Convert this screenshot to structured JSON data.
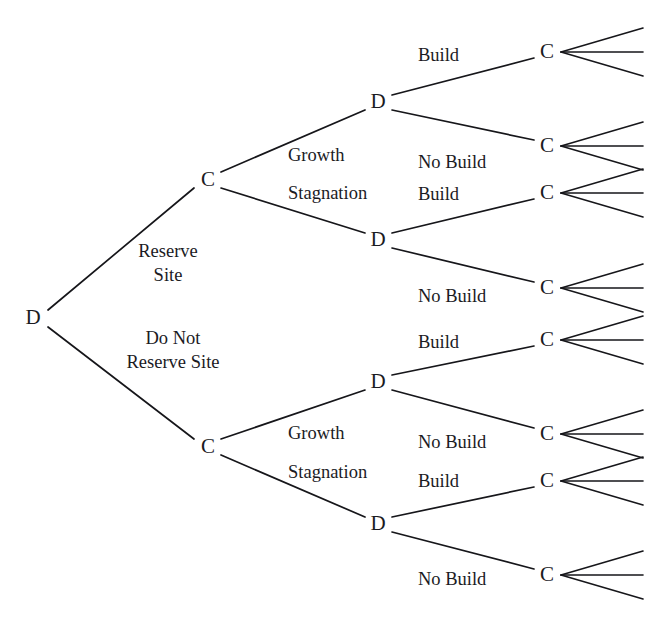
{
  "diagram": {
    "type": "decision-tree",
    "background_color": "#ffffff",
    "line_color": "#16161a",
    "text_color": "#1b1b1f"
  },
  "node_labels": {
    "decision": "D",
    "chance": "C"
  },
  "nodes": [
    {
      "id": "root",
      "glyph": "D",
      "x": 33,
      "y": 318,
      "kind": "decision"
    },
    {
      "id": "c-up",
      "glyph": "C",
      "x": 208,
      "y": 180,
      "kind": "chance"
    },
    {
      "id": "c-dn",
      "glyph": "C",
      "x": 208,
      "y": 447,
      "kind": "chance"
    },
    {
      "id": "d-1",
      "glyph": "D",
      "x": 378,
      "y": 102,
      "kind": "decision"
    },
    {
      "id": "d-2",
      "glyph": "D",
      "x": 378,
      "y": 240,
      "kind": "decision"
    },
    {
      "id": "d-3",
      "glyph": "D",
      "x": 378,
      "y": 382,
      "kind": "decision"
    },
    {
      "id": "d-4",
      "glyph": "D",
      "x": 378,
      "y": 524,
      "kind": "decision"
    },
    {
      "id": "term-1",
      "glyph": "C",
      "x": 547,
      "y": 52,
      "kind": "chance"
    },
    {
      "id": "term-2",
      "glyph": "C",
      "x": 547,
      "y": 146,
      "kind": "chance"
    },
    {
      "id": "term-3",
      "glyph": "C",
      "x": 547,
      "y": 193,
      "kind": "chance"
    },
    {
      "id": "term-4",
      "glyph": "C",
      "x": 547,
      "y": 288,
      "kind": "chance"
    },
    {
      "id": "term-5",
      "glyph": "C",
      "x": 547,
      "y": 340,
      "kind": "chance"
    },
    {
      "id": "term-6",
      "glyph": "C",
      "x": 547,
      "y": 434,
      "kind": "chance"
    },
    {
      "id": "term-7",
      "glyph": "C",
      "x": 547,
      "y": 481,
      "kind": "chance"
    },
    {
      "id": "term-8",
      "glyph": "C",
      "x": 547,
      "y": 575,
      "kind": "chance"
    }
  ],
  "edges": [
    {
      "id": "root-up",
      "from": "root",
      "to": "c-up",
      "x1": 48,
      "y1": 310,
      "x2": 194,
      "y2": 188
    },
    {
      "id": "root-dn",
      "from": "root",
      "to": "c-dn",
      "x1": 48,
      "y1": 327,
      "x2": 194,
      "y2": 439
    },
    {
      "id": "cup-d1",
      "from": "c-up",
      "to": "d-1",
      "x1": 221,
      "y1": 172,
      "x2": 365,
      "y2": 110
    },
    {
      "id": "cup-d2",
      "from": "c-up",
      "to": "d-2",
      "x1": 221,
      "y1": 188,
      "x2": 365,
      "y2": 233
    },
    {
      "id": "cdn-d3",
      "from": "c-dn",
      "to": "d-3",
      "x1": 221,
      "y1": 439,
      "x2": 365,
      "y2": 390
    },
    {
      "id": "cdn-d4",
      "from": "c-dn",
      "to": "d-4",
      "x1": 221,
      "y1": 455,
      "x2": 365,
      "y2": 517
    },
    {
      "id": "d1-t1",
      "from": "d-1",
      "to": "term-1",
      "x1": 392,
      "y1": 95,
      "x2": 534,
      "y2": 58
    },
    {
      "id": "d1-t2",
      "from": "d-1",
      "to": "term-2",
      "x1": 392,
      "y1": 110,
      "x2": 534,
      "y2": 140
    },
    {
      "id": "d2-t3",
      "from": "d-2",
      "to": "term-3",
      "x1": 392,
      "y1": 233,
      "x2": 534,
      "y2": 199
    },
    {
      "id": "d2-t4",
      "from": "d-2",
      "to": "term-4",
      "x1": 392,
      "y1": 248,
      "x2": 534,
      "y2": 282
    },
    {
      "id": "d3-t5",
      "from": "d-3",
      "to": "term-5",
      "x1": 392,
      "y1": 375,
      "x2": 534,
      "y2": 346
    },
    {
      "id": "d3-t6",
      "from": "d-3",
      "to": "term-6",
      "x1": 392,
      "y1": 390,
      "x2": 534,
      "y2": 428
    },
    {
      "id": "d4-t7",
      "from": "d-4",
      "to": "term-7",
      "x1": 392,
      "y1": 517,
      "x2": 534,
      "y2": 487
    },
    {
      "id": "d4-t8",
      "from": "d-4",
      "to": "term-8",
      "x1": 392,
      "y1": 532,
      "x2": 534,
      "y2": 569
    }
  ],
  "edge_labels": [
    {
      "id": "lbl-reserve-site",
      "lines": [
        "Reserve",
        "Site"
      ],
      "x": 168,
      "y": 257,
      "align": "center"
    },
    {
      "id": "lbl-no-reserve-site",
      "lines": [
        "Do Not",
        "Reserve Site"
      ],
      "x": 173,
      "y": 344,
      "align": "center"
    },
    {
      "id": "lbl-growth-upper",
      "lines": [
        "Growth"
      ],
      "x": 288,
      "y": 161,
      "align": "start"
    },
    {
      "id": "lbl-stagnation-upper",
      "lines": [
        "Stagnation"
      ],
      "x": 288,
      "y": 199,
      "align": "start"
    },
    {
      "id": "lbl-growth-lower",
      "lines": [
        "Growth"
      ],
      "x": 288,
      "y": 439,
      "align": "start"
    },
    {
      "id": "lbl-stagnation-lower",
      "lines": [
        "Stagnation"
      ],
      "x": 288,
      "y": 478,
      "align": "start"
    },
    {
      "id": "lbl-build-1",
      "lines": [
        "Build"
      ],
      "x": 418,
      "y": 61,
      "align": "start"
    },
    {
      "id": "lbl-no-build-1",
      "lines": [
        "No Build"
      ],
      "x": 418,
      "y": 168,
      "align": "start"
    },
    {
      "id": "lbl-build-2",
      "lines": [
        "Build"
      ],
      "x": 418,
      "y": 200,
      "align": "start"
    },
    {
      "id": "lbl-no-build-2",
      "lines": [
        "No Build"
      ],
      "x": 418,
      "y": 302,
      "align": "start"
    },
    {
      "id": "lbl-build-3",
      "lines": [
        "Build"
      ],
      "x": 418,
      "y": 348,
      "align": "start"
    },
    {
      "id": "lbl-no-build-3",
      "lines": [
        "No Build"
      ],
      "x": 418,
      "y": 448,
      "align": "start"
    },
    {
      "id": "lbl-build-4",
      "lines": [
        "Build"
      ],
      "x": 418,
      "y": 487,
      "align": "start"
    },
    {
      "id": "lbl-no-build-4",
      "lines": [
        "No Build"
      ],
      "x": 418,
      "y": 585,
      "align": "start"
    }
  ],
  "terminal_fan": {
    "branch_count": 3,
    "start_dx": 14,
    "length": 82,
    "spread": 24
  },
  "line_metrics": {
    "label_line_height": 24,
    "branch_stroke_width": 1.7,
    "fan_stroke_width": 1.6,
    "node_font_size": 21,
    "label_font_size": 18.5
  }
}
